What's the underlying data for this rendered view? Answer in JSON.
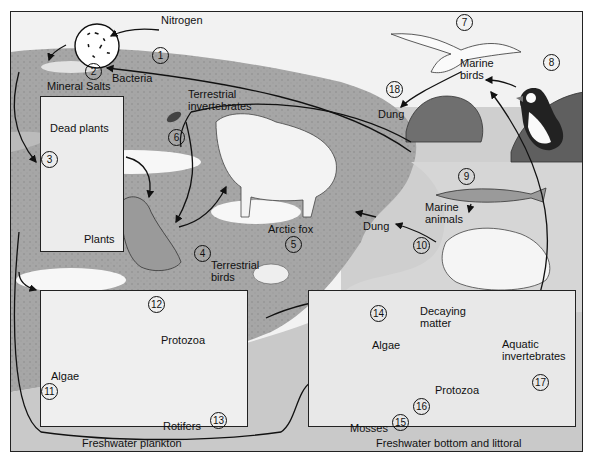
{
  "labels": {
    "nitrogen": "Nitrogen",
    "bacteria": "Bacteria",
    "mineral_salts": "Mineral Salts",
    "dead_plants": "Dead plants",
    "plants": "Plants",
    "terrestrial_invertebrates": "Terrestrial invertebrates",
    "terrestrial_birds": "Terrestrial birds",
    "arctic_fox": "Arctic fox",
    "dung_fox": "Dung",
    "dung_birds": "Dung",
    "marine_birds": "Marine birds",
    "marine_animals": "Marine animals",
    "algae_plankton": "Algae",
    "protozoa_plankton": "Protozoa",
    "rotifers": "Rotifers",
    "algae_bottom": "Algae",
    "decaying_matter": "Decaying matter",
    "aquatic_invertebrates": "Aquatic invertebrates",
    "protozoa_bottom": "Protozoa",
    "mosses": "Mosses"
  },
  "captions": {
    "plankton_box": "Freshwater plankton",
    "bottom_box": "Freshwater bottom and littoral"
  },
  "numbers": {
    "n1": "1",
    "n2": "2",
    "n3": "3",
    "n4": "4",
    "n5": "5",
    "n6": "6",
    "n7": "7",
    "n8": "8",
    "n9": "9",
    "n10": "10",
    "n11": "11",
    "n12": "12",
    "n13": "13",
    "n14": "14",
    "n15": "15",
    "n16": "16",
    "n17": "17",
    "n18": "18"
  },
  "colors": {
    "land": "#a9a9a9",
    "land_dark": "#8c8c8c",
    "water": "#d3d3d3",
    "sky": "#f4f4f4",
    "snow": "#f7f7f7",
    "box_fill": "#ececec",
    "line": "#1a1a1a"
  }
}
